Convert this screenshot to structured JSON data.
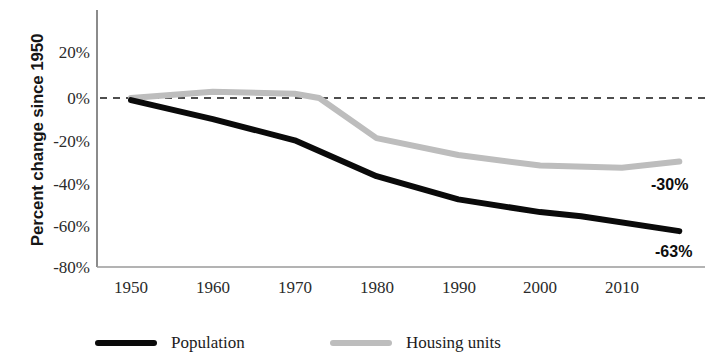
{
  "chart_data": {
    "type": "line",
    "title": "",
    "xlabel": "",
    "ylabel": "Percent change since 1950",
    "xlim": [
      1950,
      2017
    ],
    "ylim": [
      -80,
      30
    ],
    "grid": false,
    "legend_position": "bottom",
    "y_ticks": [
      "20%",
      "0%",
      "-20%",
      "-40%",
      "-60%",
      "-80%"
    ],
    "y_tick_values": [
      20,
      0,
      -20,
      -40,
      -60,
      -80
    ],
    "x_ticks": [
      "1950",
      "1960",
      "1970",
      "1980",
      "1990",
      "2000",
      "2010"
    ],
    "x_tick_values": [
      1950,
      1960,
      1970,
      1980,
      1990,
      2000,
      2010
    ],
    "zero_reference_line": 0,
    "series": [
      {
        "name": "Population",
        "color": "#0a0a0a",
        "end_label": "-63%",
        "x": [
          1950,
          1960,
          1970,
          1980,
          1990,
          2000,
          2005,
          2017
        ],
        "values": [
          -1,
          -10,
          -20,
          -37,
          -48,
          -54,
          -56,
          -63
        ]
      },
      {
        "name": "Housing units",
        "color": "#bdbdbd",
        "end_label": "-30%",
        "x": [
          1950,
          1960,
          1970,
          1973,
          1980,
          1990,
          2000,
          2010,
          2017
        ],
        "values": [
          0,
          3,
          2,
          0,
          -19,
          -27,
          -32,
          -33,
          -30
        ]
      }
    ]
  },
  "axis": {
    "y_title": "Percent change since 1950",
    "y_ticks": [
      {
        "label": "20%"
      },
      {
        "label": "0%"
      },
      {
        "label": "-20%"
      },
      {
        "label": "-40%"
      },
      {
        "label": "-60%"
      },
      {
        "label": "-80%"
      }
    ],
    "x_ticks": [
      {
        "label": "1950"
      },
      {
        "label": "1960"
      },
      {
        "label": "1970"
      },
      {
        "label": "1980"
      },
      {
        "label": "1990"
      },
      {
        "label": "2000"
      },
      {
        "label": "2010"
      }
    ]
  },
  "annotations": {
    "housing_end": "-30%",
    "population_end": "-63%"
  },
  "legend": {
    "items": [
      {
        "label": "Population",
        "color": "#0a0a0a"
      },
      {
        "label": "Housing units",
        "color": "#bdbdbd"
      }
    ]
  },
  "colors": {
    "population": "#0a0a0a",
    "housing": "#bdbdbd",
    "axis": "#6e6e6e",
    "text": "#1c1c1c"
  }
}
